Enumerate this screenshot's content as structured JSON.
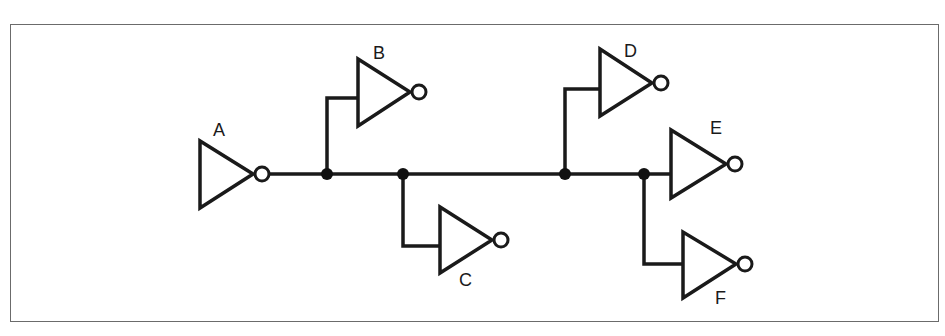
{
  "diagram": {
    "type": "logic-circuit",
    "colors": {
      "line": "#1a1a1a",
      "frame": "#6b6b6b",
      "background": "#ffffff"
    },
    "gates": [
      {
        "id": "A",
        "label": "A",
        "kind": "inverter"
      },
      {
        "id": "B",
        "label": "B",
        "kind": "inverter"
      },
      {
        "id": "C",
        "label": "C",
        "kind": "inverter"
      },
      {
        "id": "D",
        "label": "D",
        "kind": "inverter"
      },
      {
        "id": "E",
        "label": "E",
        "kind": "inverter"
      },
      {
        "id": "F",
        "label": "F",
        "kind": "inverter"
      }
    ],
    "connections": [
      {
        "from": "A",
        "to": "B"
      },
      {
        "from": "A",
        "to": "C"
      },
      {
        "from": "A",
        "to": "D"
      },
      {
        "from": "A",
        "to": "E"
      },
      {
        "from": "A",
        "to": "F"
      }
    ],
    "junction_count": 4
  }
}
